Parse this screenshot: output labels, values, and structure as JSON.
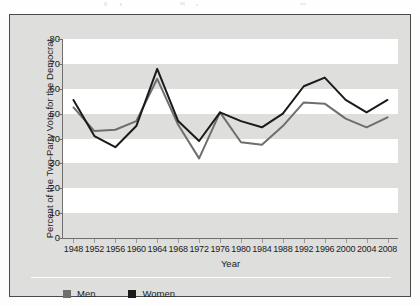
{
  "chart_data": {
    "type": "line",
    "title": "",
    "xlabel": "Year",
    "ylabel": "Percent of the Two-Party Vote for the Democrat",
    "categories": [
      1948,
      1952,
      1956,
      1960,
      1964,
      1968,
      1972,
      1976,
      1980,
      1984,
      1988,
      1992,
      1996,
      2000,
      2004,
      2008
    ],
    "x": [
      "1948",
      "1952",
      "1956",
      "1960",
      "1964",
      "1968",
      "1972",
      "1976",
      "1980",
      "1984",
      "1988",
      "1992",
      "1996",
      "2000",
      "2004",
      "2008"
    ],
    "series": [
      {
        "name": "Men",
        "color": "#6e6e6e",
        "values": [
          52.5,
          43.0,
          43.5,
          47.0,
          64.0,
          45.5,
          32.0,
          50.5,
          38.5,
          37.5,
          45.0,
          54.5,
          54.0,
          48.0,
          44.5,
          48.5
        ]
      },
      {
        "name": "Women",
        "color": "#1a1a1a",
        "values": [
          55.5,
          41.0,
          36.5,
          45.0,
          68.0,
          47.0,
          39.0,
          50.5,
          47.0,
          44.5,
          50.0,
          61.0,
          64.5,
          55.5,
          50.5,
          55.5
        ]
      }
    ],
    "ylim": [
      0,
      80
    ],
    "ytick_labels": [
      "0",
      "10",
      "20",
      "30",
      "40",
      "50",
      "60",
      "70",
      "80"
    ],
    "ytick_values": [
      0,
      10,
      20,
      30,
      40,
      50,
      60,
      70,
      80
    ],
    "grid": "horizontal-alternating-bands",
    "legend_position": "bottom-left",
    "legend": [
      {
        "label": "Men",
        "color": "#6e6e6e"
      },
      {
        "label": "Women",
        "color": "#1a1a1a"
      }
    ]
  },
  "axes": {
    "x_title": "Year",
    "y_title": "Percent of the Two-Party Vote for the Democrat"
  }
}
